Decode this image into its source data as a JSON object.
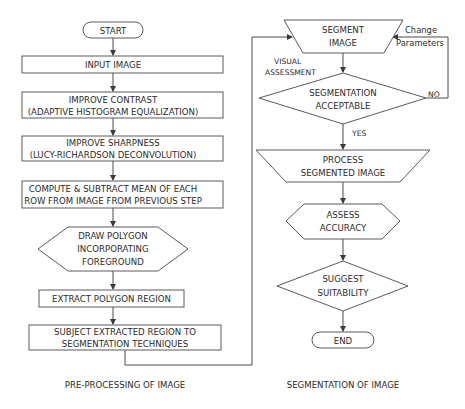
{
  "left_column": {
    "caption": "PRE-PROCESSING OF IMAGE",
    "nodes": [
      {
        "id": "start",
        "shape": "terminal",
        "lines": [
          "START"
        ]
      },
      {
        "id": "input-image",
        "shape": "process",
        "lines": [
          "INPUT IMAGE"
        ]
      },
      {
        "id": "improve-contrast",
        "shape": "process",
        "lines": [
          "IMPROVE CONTRAST",
          "(ADAPTIVE HISTOGRAM EQUALIZATION)"
        ]
      },
      {
        "id": "improve-sharpness",
        "shape": "process",
        "lines": [
          "IMPROVE SHARPNESS",
          "(LUCY-RICHARDSON  DECONVOLUTION)"
        ]
      },
      {
        "id": "compute-subtract-mean",
        "shape": "process",
        "lines": [
          "COMPUTE & SUBTRACT MEAN OF EACH",
          "ROW FROM IMAGE FROM PREVIOUS STEP"
        ]
      },
      {
        "id": "draw-polygon",
        "shape": "preparation",
        "lines": [
          "DRAW POLYGON",
          "INCORPORATING",
          "FOREGROUND"
        ]
      },
      {
        "id": "extract-polygon",
        "shape": "process",
        "lines": [
          "EXTRACT  POLYGON REGION"
        ]
      },
      {
        "id": "subject-region",
        "shape": "process",
        "lines": [
          "SUBJECT EXTRACTED REGION TO",
          "SEGMENTATION TECHNIQUES"
        ]
      }
    ]
  },
  "right_column": {
    "caption": "SEGMENTATION OF IMAGE",
    "nodes": [
      {
        "id": "segment-image",
        "shape": "manual-operation",
        "lines": [
          "SEGMENT",
          "IMAGE"
        ]
      },
      {
        "id": "segmentation-acceptable",
        "shape": "decision",
        "lines": [
          "SEGMENTATION",
          "ACCEPTABLE"
        ]
      },
      {
        "id": "process-segmented",
        "shape": "manual-operation",
        "lines": [
          "PROCESS",
          "SEGMENTED IMAGE"
        ]
      },
      {
        "id": "assess-accuracy",
        "shape": "preparation",
        "lines": [
          "ASSESS",
          "ACCURACY"
        ]
      },
      {
        "id": "suggest-suitability",
        "shape": "decision",
        "lines": [
          "SUGGEST",
          "SUITABILITY"
        ]
      },
      {
        "id": "end",
        "shape": "terminal",
        "lines": [
          "END"
        ]
      }
    ]
  },
  "edge_labels": {
    "visual_assessment": [
      "VISUAL",
      "ASSESSMENT"
    ],
    "change_parameters": [
      "Change",
      "Parameters"
    ],
    "no": "NO",
    "yes": "YES"
  },
  "colors": {
    "stroke": "#5a5a5a",
    "text": "#2b2b2b",
    "background": "#ffffff"
  }
}
